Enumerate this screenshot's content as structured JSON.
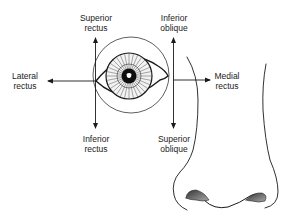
{
  "diagram": {
    "colors": {
      "line": "#1a1a1a",
      "background": "#ffffff",
      "shade": "#555555"
    },
    "labels": {
      "superior_rectus": {
        "line1": "Superior",
        "line2": "rectus"
      },
      "inferior_oblique": {
        "line1": "Inferior",
        "line2": "oblique"
      },
      "lateral_rectus": {
        "line1": "Lateral",
        "line2": "rectus"
      },
      "medial_rectus": {
        "line1": "Medial",
        "line2": "rectus"
      },
      "inferior_rectus": {
        "line1": "Inferior",
        "line2": "rectus"
      },
      "superior_oblique": {
        "line1": "Superior",
        "line2": "oblique"
      }
    },
    "components": [
      "eye",
      "iris",
      "pupil",
      "orbit-circle",
      "nose",
      "action-arrows"
    ]
  }
}
